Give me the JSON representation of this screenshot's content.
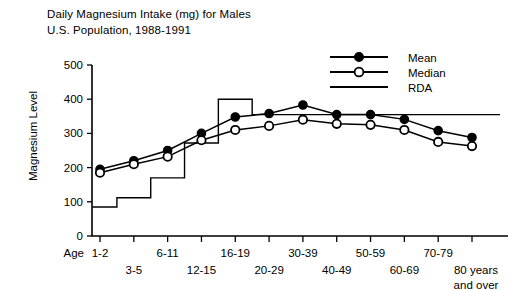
{
  "chart_data": {
    "type": "line",
    "title": "Daily Magnesium Intake (mg) for Males",
    "subtitle": "U.S. Population, 1988-1991",
    "xlabel": "Age",
    "ylabel": "Magnesium Level",
    "ylim": [
      0,
      500
    ],
    "yticks": [
      0,
      100,
      200,
      300,
      400,
      500
    ],
    "grid": false,
    "legend_position": "top-right",
    "categories": [
      "1-2",
      "3-5",
      "6-11",
      "12-15",
      "16-19",
      "20-29",
      "30-39",
      "40-49",
      "50-59",
      "60-69",
      "70-79",
      "80 years and over"
    ],
    "series": [
      {
        "name": "Mean",
        "marker": "filled-circle",
        "values": [
          195,
          220,
          250,
          300,
          348,
          358,
          383,
          355,
          355,
          341,
          308,
          288
        ]
      },
      {
        "name": "Median",
        "marker": "open-circle",
        "values": [
          185,
          210,
          232,
          280,
          310,
          322,
          340,
          328,
          325,
          310,
          275,
          263
        ]
      },
      {
        "name": "RDA",
        "marker": "none",
        "step": true,
        "values": [
          85,
          112,
          170,
          272,
          400,
          355,
          355,
          355,
          355,
          355,
          355,
          355
        ]
      }
    ],
    "annotations": []
  },
  "legend": {
    "items": [
      {
        "label": "Mean",
        "marker": "filled-circle"
      },
      {
        "label": "Median",
        "marker": "open-circle"
      },
      {
        "label": "RDA",
        "marker": "line"
      }
    ]
  },
  "axis": {
    "age_label": "Age",
    "ytick_labels": [
      "0",
      "100",
      "200",
      "300",
      "400",
      "500"
    ],
    "xtick_labels_row1": [
      "1-2",
      "",
      "6-11",
      "",
      "16-19",
      "",
      "30-39",
      "",
      "50-59",
      "",
      "70-79",
      ""
    ],
    "xtick_labels_row2": [
      "",
      "3-5",
      "",
      "12-15",
      "",
      "20-29",
      "",
      "40-49",
      "",
      "60-69",
      "",
      "80 years"
    ],
    "xtick_labels_row3": [
      "",
      "",
      "",
      "",
      "",
      "",
      "",
      "",
      "",
      "",
      "",
      "and over"
    ]
  },
  "colors": {
    "ink": "#000000",
    "background": "#ffffff"
  }
}
